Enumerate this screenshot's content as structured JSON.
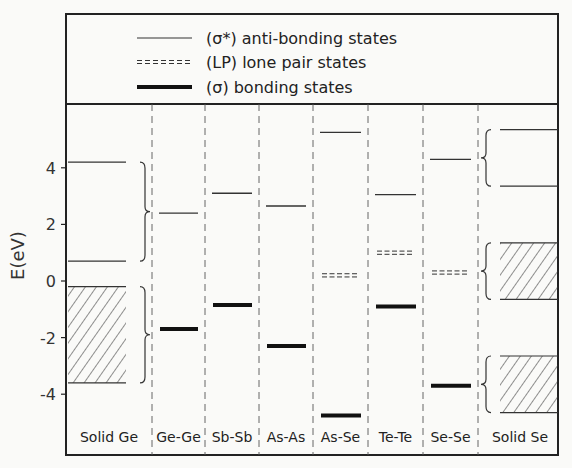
{
  "chart_data": {
    "type": "energy-level-diagram",
    "ylabel": "E(eV)",
    "ylim": [
      -5.8,
      6.2
    ],
    "yticks": [
      4,
      2,
      0,
      -2,
      -4
    ],
    "legend": [
      {
        "style": "thin",
        "label": "(σ*) anti-bonding states"
      },
      {
        "style": "dashed-double",
        "label": "(LP) lone pair states"
      },
      {
        "style": "thick",
        "label": "(σ) bonding states"
      }
    ],
    "categories": [
      "Solid Ge",
      "Ge-Ge",
      "Sb-Sb",
      "As-As",
      "As-Se",
      "Te-Te",
      "Se-Se",
      "Solid Se"
    ],
    "columns": [
      {
        "name": "Solid Ge",
        "antibonding": [
          4.2,
          0.7
        ],
        "lone_pair": [],
        "bonding": [],
        "bands": [
          {
            "from": -0.2,
            "to": -3.6
          }
        ]
      },
      {
        "name": "Ge-Ge",
        "antibonding": [
          2.4
        ],
        "lone_pair": [],
        "bonding": [
          -1.7
        ],
        "bands": []
      },
      {
        "name": "Sb-Sb",
        "antibonding": [
          3.1
        ],
        "lone_pair": [],
        "bonding": [
          -0.85
        ],
        "bands": []
      },
      {
        "name": "As-As",
        "antibonding": [
          2.65
        ],
        "lone_pair": [],
        "bonding": [
          -2.3
        ],
        "bands": []
      },
      {
        "name": "As-Se",
        "antibonding": [
          5.25
        ],
        "lone_pair": [
          0.2
        ],
        "bonding": [
          -4.75
        ],
        "bands": []
      },
      {
        "name": "Te-Te",
        "antibonding": [
          3.05
        ],
        "lone_pair": [
          1.0
        ],
        "bonding": [
          -0.9
        ],
        "bands": []
      },
      {
        "name": "Se-Se",
        "antibonding": [
          4.3
        ],
        "lone_pair": [
          0.3
        ],
        "bonding": [
          -3.7
        ],
        "bands": []
      },
      {
        "name": "Solid Se",
        "antibonding": [
          5.35,
          3.35
        ],
        "lone_pair": [],
        "bonding": [],
        "bands": [
          {
            "from": 1.35,
            "to": -0.65
          },
          {
            "from": -2.65,
            "to": -4.65
          }
        ]
      }
    ],
    "braces": [
      {
        "between": "Solid Ge|Ge-Ge",
        "from": 4.2,
        "to": 0.7
      },
      {
        "between": "Solid Ge|Ge-Ge",
        "from": -0.2,
        "to": -3.6
      },
      {
        "between": "Se-Se|Solid Se",
        "from": 5.35,
        "to": 3.35
      },
      {
        "between": "Se-Se|Solid Se",
        "from": 1.35,
        "to": -0.65
      },
      {
        "between": "Se-Se|Solid Se",
        "from": -2.65,
        "to": -4.65
      }
    ]
  }
}
